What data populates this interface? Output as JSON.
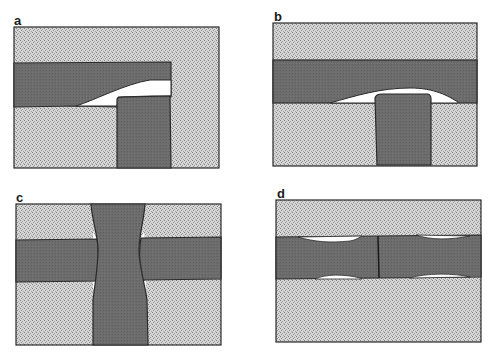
{
  "figure": {
    "colors": {
      "background": "#ffffff",
      "matrix_fill": "#d4d4d4",
      "matrix_stipple": "#8a8a8a",
      "phase_fill": "#6b6b6b",
      "outline": "#2a2a2a",
      "void": "#ffffff"
    },
    "panels": [
      {
        "id": "a",
        "label": "a",
        "description": "Horizontal band meeting vertical pillar at corner with wedge-shaped void"
      },
      {
        "id": "b",
        "label": "b",
        "description": "Pillar pushing into continuous horizontal band with lens-shaped void"
      },
      {
        "id": "c",
        "label": "c",
        "description": "Vertical pillar crossing horizontal band, necked at intersection"
      },
      {
        "id": "d",
        "label": "d",
        "description": "Horizontal band split by grain boundary with lenticular voids"
      }
    ]
  }
}
